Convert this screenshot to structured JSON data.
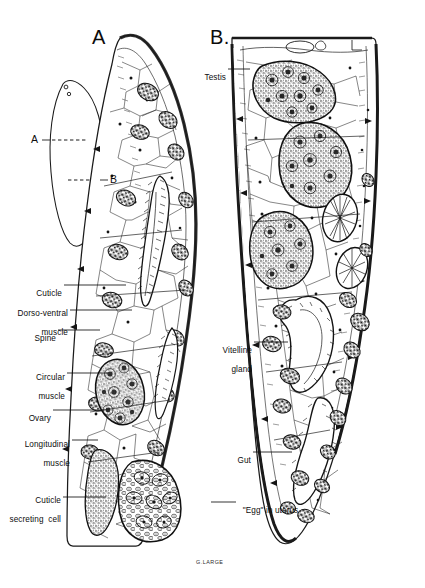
{
  "figure": {
    "background_color": "#ffffff",
    "ink_color": "#111111",
    "signature": "G.LARGE"
  },
  "panels": [
    {
      "id": "A",
      "letter": "A",
      "caption": "Transverse section at level A (anterior)"
    },
    {
      "id": "B",
      "letter": "B.",
      "caption": "Transverse section at level B (posterior)"
    }
  ],
  "inset": {
    "name": "whole-body-outline",
    "section_marks": [
      {
        "label": "A",
        "side": "left"
      },
      {
        "label": "B",
        "side": "right"
      }
    ]
  },
  "labels_left": [
    {
      "text": "Cuticle",
      "lines": [
        "Cuticle"
      ]
    },
    {
      "text": "Dorso-ventral muscle",
      "lines": [
        "Dorso-ventral",
        "muscle"
      ]
    },
    {
      "text": "Spine",
      "lines": [
        "Spine"
      ]
    },
    {
      "text": "Circular muscle",
      "lines": [
        "Circular",
        "muscle"
      ]
    },
    {
      "text": "Ovary",
      "lines": [
        "Ovary"
      ]
    },
    {
      "text": "Longitudinal muscle",
      "lines": [
        "Longitudinal",
        "muscle"
      ]
    },
    {
      "text": "Cuticle secreting cell",
      "lines": [
        "Cuticle",
        "secreting  cell"
      ]
    }
  ],
  "labels_right": [
    {
      "text": "Testis",
      "lines": [
        "Testis"
      ]
    },
    {
      "text": "Vitelline gland",
      "lines": [
        "Vitelline",
        "gland"
      ]
    },
    {
      "text": "Gut",
      "lines": [
        "Gut"
      ]
    },
    {
      "text": "\"Egg\" in uterus",
      "lines": [
        "\"Egg\" in uterus"
      ]
    }
  ]
}
